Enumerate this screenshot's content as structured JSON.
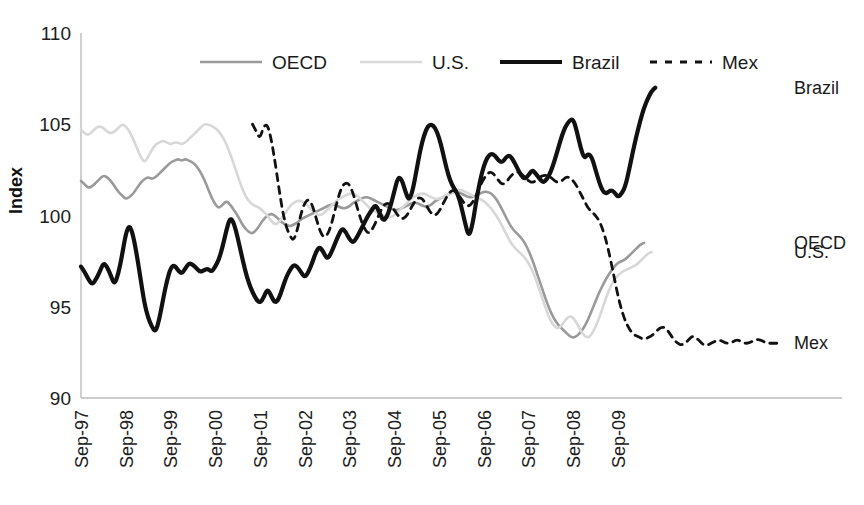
{
  "chart_data": {
    "type": "line",
    "title": "",
    "xlabel": "",
    "ylabel": "Index",
    "ylim": [
      90,
      110
    ],
    "yticks": [
      90,
      95,
      100,
      105,
      110
    ],
    "grid": false,
    "legend_position": "top-center",
    "x_tick_labels": [
      "Sep-97",
      "Sep-98",
      "Sep-99",
      "Sep-00",
      "Sep-01",
      "Sep-02",
      "Sep-03",
      "Sep-04",
      "Sep-05",
      "Sep-06",
      "Sep-07",
      "Sep-08",
      "Sep-09"
    ],
    "x_start": "Sep-97",
    "x_end": "Jun-10",
    "x_step_months": 1,
    "series": [
      {
        "name": "OECD",
        "color": "#9a9a9a",
        "style": "solid",
        "width": 2.6,
        "end_label": "OECD",
        "x_offset_months": 0,
        "values": [
          101.9,
          101.7,
          101.5,
          101.6,
          101.8,
          102.0,
          102.2,
          102.1,
          101.9,
          101.6,
          101.3,
          101.1,
          100.9,
          101.0,
          101.2,
          101.5,
          101.8,
          102.0,
          102.1,
          102.0,
          102.1,
          102.3,
          102.5,
          102.7,
          102.9,
          103.0,
          103.1,
          103.0,
          103.1,
          103.0,
          102.9,
          102.7,
          102.4,
          102.0,
          101.5,
          101.0,
          100.6,
          100.4,
          100.6,
          100.8,
          100.6,
          100.3,
          100.0,
          99.6,
          99.3,
          99.1,
          99.0,
          99.2,
          99.5,
          99.8,
          100.0,
          100.1,
          100.0,
          99.8,
          99.6,
          99.5,
          99.4,
          99.5,
          99.6,
          99.8,
          99.9,
          100.0,
          100.1,
          100.2,
          100.3,
          100.4,
          100.5,
          100.6,
          100.6,
          100.5,
          100.4,
          100.4,
          100.5,
          100.7,
          100.8,
          100.9,
          101.0,
          101.0,
          100.9,
          100.8,
          100.7,
          100.6,
          100.5,
          100.4,
          100.3,
          100.3,
          100.4,
          100.5,
          100.6,
          100.7,
          100.7,
          100.6,
          100.5,
          100.5,
          100.6,
          100.8,
          100.9,
          101.0,
          101.1,
          101.2,
          101.3,
          101.3,
          101.2,
          101.1,
          101.0,
          101.0,
          101.1,
          101.2,
          101.3,
          101.3,
          101.2,
          101.0,
          100.7,
          100.3,
          99.9,
          99.5,
          99.2,
          99.0,
          98.8,
          98.5,
          98.1,
          97.6,
          97.0,
          96.4,
          95.8,
          95.2,
          94.7,
          94.3,
          94.0,
          93.8,
          93.6,
          93.4,
          93.3,
          93.4,
          93.6,
          93.9,
          94.3,
          94.8,
          95.3,
          95.8,
          96.2,
          96.6,
          96.9,
          97.2,
          97.4,
          97.5,
          97.6,
          97.8,
          98.0,
          98.2,
          98.4,
          98.5
        ]
      },
      {
        "name": "U.S.",
        "color": "#d8d8d8",
        "style": "solid",
        "width": 2.6,
        "end_label": "U.S.",
        "x_offset_months": 0,
        "values": [
          104.7,
          104.5,
          104.4,
          104.6,
          104.8,
          104.9,
          104.8,
          104.6,
          104.5,
          104.6,
          104.8,
          105.0,
          104.9,
          104.6,
          104.2,
          103.7,
          103.2,
          102.9,
          103.2,
          103.6,
          103.9,
          104.0,
          104.1,
          104.0,
          103.9,
          104.0,
          104.0,
          103.9,
          104.0,
          104.2,
          104.4,
          104.6,
          104.8,
          105.0,
          105.0,
          104.9,
          104.8,
          104.6,
          104.3,
          103.9,
          103.4,
          102.8,
          102.2,
          101.6,
          101.1,
          100.8,
          100.6,
          100.5,
          100.4,
          100.2,
          100.0,
          99.7,
          99.5,
          99.6,
          99.9,
          100.2,
          100.5,
          100.7,
          100.8,
          100.8,
          100.7,
          100.5,
          100.3,
          100.1,
          100.0,
          100.1,
          100.3,
          100.5,
          100.7,
          100.9,
          101.0,
          101.1,
          101.2,
          101.2,
          101.1,
          100.9,
          100.7,
          100.5,
          100.3,
          100.2,
          100.1,
          100.0,
          99.9,
          99.9,
          100.0,
          100.2,
          100.4,
          100.6,
          100.8,
          101.0,
          101.1,
          101.2,
          101.2,
          101.1,
          101.0,
          100.9,
          100.9,
          101.0,
          101.1,
          101.2,
          101.3,
          101.4,
          101.4,
          101.3,
          101.2,
          101.1,
          101.0,
          100.9,
          100.8,
          100.6,
          100.4,
          100.1,
          99.8,
          99.4,
          99.0,
          98.6,
          98.3,
          98.1,
          97.9,
          97.7,
          97.4,
          97.0,
          96.5,
          95.9,
          95.3,
          94.7,
          94.2,
          93.9,
          93.8,
          94.0,
          94.3,
          94.5,
          94.4,
          94.1,
          93.7,
          93.4,
          93.3,
          93.5,
          93.9,
          94.4,
          95.0,
          95.6,
          96.1,
          96.5,
          96.7,
          96.9,
          97.0,
          97.1,
          97.2,
          97.3,
          97.5,
          97.7,
          97.9,
          98.0
        ]
      },
      {
        "name": "Brazil",
        "color": "#111111",
        "style": "solid",
        "width": 4.2,
        "end_label": "Brazil",
        "x_offset_months": 0,
        "values": [
          97.2,
          96.9,
          96.5,
          96.2,
          96.5,
          96.9,
          97.4,
          97.2,
          96.7,
          96.2,
          96.8,
          97.8,
          99.0,
          99.5,
          98.9,
          97.8,
          96.5,
          95.2,
          94.4,
          93.9,
          93.6,
          94.3,
          95.4,
          96.4,
          97.1,
          97.3,
          97.0,
          96.8,
          97.1,
          97.4,
          97.3,
          97.1,
          96.9,
          97.0,
          97.1,
          96.9,
          97.2,
          97.6,
          98.3,
          99.2,
          99.9,
          99.6,
          98.8,
          97.9,
          97.0,
          96.3,
          95.8,
          95.4,
          95.2,
          95.5,
          96.0,
          95.6,
          95.2,
          95.4,
          96.0,
          96.6,
          97.0,
          97.3,
          97.2,
          96.9,
          96.6,
          96.9,
          97.4,
          98.0,
          98.3,
          98.0,
          97.6,
          97.9,
          98.4,
          98.9,
          99.3,
          99.1,
          98.7,
          98.5,
          98.8,
          99.2,
          99.6,
          100.0,
          100.3,
          100.6,
          100.2,
          99.7,
          99.9,
          100.5,
          101.3,
          102.1,
          102.0,
          101.3,
          100.8,
          101.4,
          102.5,
          103.6,
          104.4,
          104.9,
          105.0,
          104.8,
          104.3,
          103.5,
          102.6,
          101.9,
          101.5,
          101.2,
          100.5,
          99.6,
          98.8,
          99.5,
          100.8,
          101.9,
          102.7,
          103.2,
          103.4,
          103.3,
          103.0,
          102.9,
          103.2,
          103.3,
          103.0,
          102.6,
          102.2,
          102.0,
          102.2,
          102.5,
          102.3,
          102.0,
          101.8,
          102.0,
          102.4,
          103.0,
          103.7,
          104.4,
          104.9,
          105.2,
          105.3,
          104.6,
          103.7,
          103.1,
          103.4,
          103.2,
          102.5,
          101.8,
          101.3,
          101.2,
          101.4,
          101.3,
          101.0,
          101.2,
          101.6,
          102.5,
          103.5,
          104.4,
          105.2,
          105.9,
          106.4,
          106.8,
          107.0
        ]
      },
      {
        "name": "Mex",
        "color": "#111111",
        "style": "dashed",
        "width": 2.8,
        "end_label": "Mex",
        "x_offset_months": 46,
        "values": [
          105.0,
          104.6,
          104.2,
          104.9,
          105.0,
          104.2,
          103.0,
          101.6,
          100.3,
          99.4,
          98.9,
          98.6,
          99.2,
          100.1,
          100.7,
          100.9,
          100.6,
          99.9,
          99.2,
          98.8,
          98.9,
          99.4,
          100.2,
          101.0,
          101.6,
          101.8,
          101.7,
          101.2,
          100.5,
          99.8,
          99.3,
          99.0,
          99.2,
          99.6,
          100.1,
          100.5,
          100.7,
          100.6,
          100.3,
          100.0,
          99.8,
          99.9,
          100.2,
          100.6,
          100.9,
          101.0,
          100.8,
          100.4,
          100.1,
          100.0,
          100.2,
          100.6,
          101.0,
          101.3,
          101.4,
          101.2,
          100.9,
          100.6,
          100.5,
          100.7,
          101.1,
          101.6,
          102.0,
          102.3,
          102.4,
          102.2,
          101.9,
          101.7,
          101.8,
          102.1,
          102.3,
          102.4,
          102.3,
          102.1,
          101.9,
          101.8,
          101.9,
          102.1,
          102.2,
          102.2,
          102.1,
          101.9,
          101.8,
          101.9,
          102.1,
          102.1,
          101.9,
          101.6,
          101.2,
          100.8,
          100.4,
          100.2,
          100.0,
          99.7,
          99.2,
          98.5,
          97.6,
          96.6,
          95.6,
          94.8,
          94.2,
          93.8,
          93.5,
          93.4,
          93.3,
          93.2,
          93.3,
          93.4,
          93.6,
          93.8,
          93.9,
          93.8,
          93.5,
          93.2,
          93.0,
          92.9,
          93.0,
          93.2,
          93.4,
          93.3,
          93.1,
          92.9,
          92.9,
          93.0,
          93.1,
          93.2,
          93.1,
          93.0,
          93.0,
          93.1,
          93.2,
          93.1,
          93.0,
          93.0,
          93.1,
          93.2,
          93.2,
          93.1,
          93.0,
          93.0,
          93.0,
          93.0,
          93.0
        ]
      }
    ]
  },
  "legend": {
    "items": [
      {
        "label": "OECD",
        "swatch": "line-swatch-gray"
      },
      {
        "label": "U.S.",
        "swatch": "line-swatch-lightgray"
      },
      {
        "label": "Brazil",
        "swatch": "line-swatch-black-thick"
      },
      {
        "label": "Mex",
        "swatch": "line-swatch-black-dashed"
      }
    ]
  },
  "axes": {
    "y_label": "Index",
    "y_ticks": [
      "110",
      "105",
      "100",
      "95",
      "90"
    ],
    "x_ticks": [
      "Sep-97",
      "Sep-98",
      "Sep-99",
      "Sep-00",
      "Sep-01",
      "Sep-02",
      "Sep-03",
      "Sep-04",
      "Sep-05",
      "Sep-06",
      "Sep-07",
      "Sep-08",
      "Sep-09"
    ]
  },
  "end_labels": [
    {
      "name": "Brazil",
      "text": "Brazil"
    },
    {
      "name": "OECD",
      "text": "OECD"
    },
    {
      "name": "U.S.",
      "text": "U.S."
    },
    {
      "name": "Mex",
      "text": "Mex"
    }
  ]
}
